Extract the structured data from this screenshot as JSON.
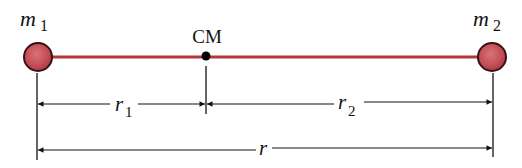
{
  "diagram": {
    "type": "two-body center of mass",
    "colors": {
      "rod": "#b5363a",
      "mass_fill": "#c9555c",
      "mass_stroke": "#3a1214",
      "ink": "#111111",
      "background": "#ffffff"
    },
    "masses": [
      {
        "id": "m1",
        "symbol": "m",
        "subscript": "1"
      },
      {
        "id": "m2",
        "symbol": "m",
        "subscript": "2"
      }
    ],
    "center_of_mass": {
      "label": "CM"
    },
    "dimensions": {
      "r1": {
        "symbol": "r",
        "subscript": "1"
      },
      "r2": {
        "symbol": "r",
        "subscript": "2"
      },
      "r": {
        "symbol": "r"
      }
    }
  }
}
